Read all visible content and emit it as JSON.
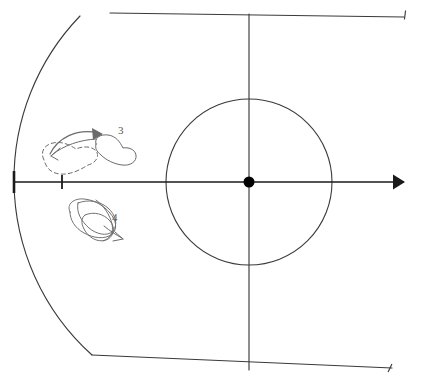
{
  "figure": {
    "background_color": "#ffffff",
    "width": 427,
    "height": 386,
    "ink_color": "#3a3a3a",
    "axis_color": "#1a1a1a",
    "sketch_color": "#6b6b6b",
    "label_color": "#555555"
  },
  "origin": {
    "label": "origin-point",
    "x": 249,
    "y": 182,
    "radius": 5.5,
    "fill": "#000000"
  },
  "axes": {
    "horizontal": {
      "name": "horizontal-axis",
      "x1": 14,
      "y1": 182,
      "x2": 404,
      "y2": 182,
      "arrow_at": "right",
      "arrow_x": 405,
      "arrow_size": 7.5
    },
    "vertical": {
      "name": "vertical-axis",
      "x1": 249,
      "y1": 14,
      "x2": 249,
      "y2": 370
    },
    "diagonal_up": {
      "name": "diagonal-axis-up-right",
      "x1": 110,
      "y1": 13,
      "x2": 404,
      "y2": 17
    },
    "diagonal_down": {
      "name": "diagonal-axis-down-right",
      "x1": 92,
      "y1": 355,
      "x2": 392,
      "y2": 368
    }
  },
  "ticks": [
    {
      "name": "tick-major-left",
      "x": 14,
      "y": 182,
      "half_height": 11,
      "width": 2.6
    },
    {
      "name": "tick-minor-inner",
      "x": 62,
      "y": 182,
      "half_height": 7,
      "width": 1.8
    }
  ],
  "end_marks": [
    {
      "name": "end-tick-top-right",
      "x": 405,
      "y": 15,
      "angle": -8
    },
    {
      "name": "end-tick-bottom-right",
      "x": 390,
      "y": 368,
      "angle": 10
    }
  ],
  "circle": {
    "name": "inner-circle",
    "cx": 249,
    "cy": 182,
    "r": 83,
    "stroke": "#3a3a3a",
    "stroke_width": 1.1
  },
  "arc": {
    "name": "outer-arc",
    "cx": 249,
    "cy": 182,
    "r": 236,
    "start_x": 80,
    "start_y": 16,
    "mid_x": 14,
    "mid_y": 182,
    "end_x": 92,
    "end_y": 355,
    "stroke": "#3a3a3a",
    "stroke_width": 1.1
  },
  "regions": [
    {
      "name": "region-dashed-source",
      "style": "dashed",
      "label": "",
      "center_x": 72,
      "center_y": 153,
      "stroke_dasharray": "4,3"
    },
    {
      "name": "region-solid-target",
      "style": "solid",
      "label": "3",
      "label_x": 118,
      "label_y": 134,
      "center_x": 112,
      "center_y": 148
    },
    {
      "name": "region-tangled",
      "style": "solid",
      "label": "4",
      "label_x": 112,
      "label_y": 221,
      "center_x": 95,
      "center_y": 220
    }
  ],
  "labels": [
    {
      "name": "region-label-3",
      "text": "3",
      "x": 118,
      "y": 134
    },
    {
      "name": "region-label-4",
      "text": "4",
      "x": 112,
      "y": 221
    }
  ],
  "flow_arrows": [
    {
      "name": "flow-arrow-forward",
      "description": "arrow from dashed region to solid region 3",
      "from_x": 55,
      "from_y": 152,
      "to_x": 100,
      "to_y": 136
    },
    {
      "name": "flow-arrow-return",
      "description": "arrow returning from region 3 back toward dashed region",
      "from_x": 95,
      "from_y": 141,
      "to_x": 52,
      "to_y": 156
    },
    {
      "name": "flow-arrow-region4",
      "description": "small arrow at lower right of tangled region 4",
      "from_x": 108,
      "from_y": 228,
      "to_x": 120,
      "to_y": 238
    }
  ]
}
